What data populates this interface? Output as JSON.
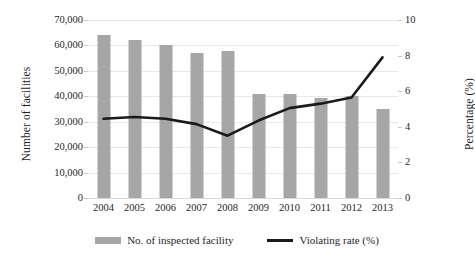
{
  "chart_data": {
    "type": "bar",
    "title": "",
    "xlabel": "",
    "ylabel": "Number of facilities",
    "y2label": "Percentage (%)",
    "categories": [
      "2004",
      "2005",
      "2006",
      "2007",
      "2008",
      "2009",
      "2010",
      "2011",
      "2012",
      "2013"
    ],
    "ylim": [
      0,
      70000
    ],
    "y2lim": [
      0,
      10
    ],
    "yticks": [
      0,
      10000,
      20000,
      30000,
      40000,
      50000,
      60000,
      70000
    ],
    "ytick_labels": [
      "0",
      "10,000",
      "20,000",
      "30,000",
      "40,000",
      "50,000",
      "60,000",
      "70,000"
    ],
    "y2ticks": [
      0,
      2,
      4,
      6,
      8,
      10
    ],
    "y2tick_labels": [
      "0",
      "2",
      "4",
      "6",
      "8",
      "10"
    ],
    "grid": true,
    "legend_position": "bottom",
    "series": [
      {
        "name": "No. of inspected facility",
        "type": "bar",
        "axis": "left",
        "color": "#a6a6a6",
        "values": [
          64000,
          62000,
          60000,
          57000,
          57800,
          41000,
          40800,
          39500,
          40000,
          35200
        ]
      },
      {
        "name": "Violating rate (%)",
        "type": "line",
        "axis": "right",
        "color": "#1a1a1a",
        "values": [
          4.45,
          4.55,
          4.45,
          4.15,
          3.5,
          4.35,
          5.05,
          5.3,
          5.65,
          7.9
        ]
      }
    ]
  },
  "legend": {
    "items": [
      {
        "label": "No. of inspected facility",
        "marker": "bar-swatch"
      },
      {
        "label": "Violating rate (%)",
        "marker": "line-swatch"
      }
    ]
  }
}
